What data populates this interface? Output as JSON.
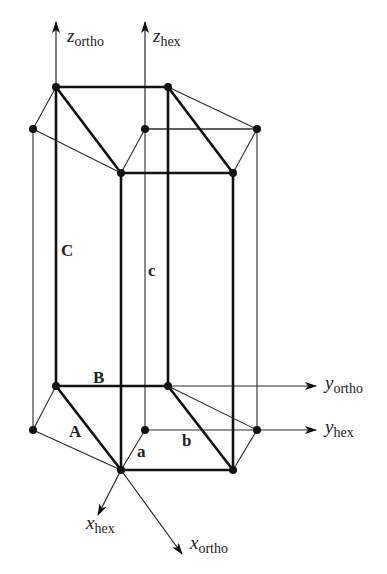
{
  "axes": {
    "z_ortho": {
      "main": "z",
      "sub": "ortho"
    },
    "z_hex": {
      "main": "z",
      "sub": "hex"
    },
    "y_ortho": {
      "main": "y",
      "sub": "ortho"
    },
    "y_hex": {
      "main": "y",
      "sub": "hex"
    },
    "x_hex": {
      "main": "x",
      "sub": "hex"
    },
    "x_ortho": {
      "main": "x",
      "sub": "ortho"
    }
  },
  "edge_labels": {
    "A": "A",
    "B": "B",
    "C": "C",
    "a": "a",
    "b": "b",
    "c": "c"
  },
  "colors": {
    "line": "#111111",
    "background": "#ffffff"
  }
}
